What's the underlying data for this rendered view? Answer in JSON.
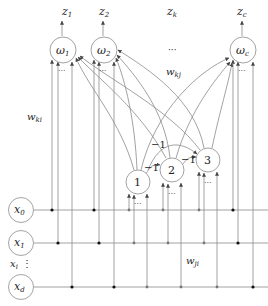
{
  "diagram": {
    "title": "",
    "outputs": [
      {
        "label": "z",
        "sub": "1"
      },
      {
        "label": "z",
        "sub": "2"
      },
      {
        "label": "z",
        "sub": "k"
      },
      {
        "label": "z",
        "sub": "c"
      }
    ],
    "output_nodes": [
      {
        "label": "ω",
        "sub": "1"
      },
      {
        "label": "ω",
        "sub": "2"
      },
      {
        "label": "ω",
        "sub": "c"
      }
    ],
    "hidden_nodes": [
      {
        "label": "1"
      },
      {
        "label": "2"
      },
      {
        "label": "3"
      }
    ],
    "input_nodes": [
      {
        "label": "x",
        "sub": "0"
      },
      {
        "label": "x",
        "sub": "1"
      },
      {
        "label": "x",
        "sub": "d"
      }
    ],
    "input_ellipsis": {
      "label": "x",
      "sub": "i",
      "dots": "⋮"
    },
    "weights": {
      "wki": {
        "label": "w",
        "sub": "ki"
      },
      "wkj": {
        "label": "w",
        "sub": "kj"
      },
      "wji": {
        "label": "w",
        "sub": "ji"
      }
    },
    "inhibitory_labels": [
      "−1",
      "−1",
      "−1"
    ],
    "ellipsis": "···"
  }
}
